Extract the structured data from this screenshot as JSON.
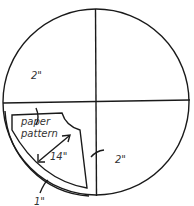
{
  "diagram": {
    "labels": {
      "top_margin": "2\"",
      "pattern_line1": "paper",
      "pattern_line2": "pattern",
      "dimension": "14\"",
      "right_margin": "2\"",
      "bottom_margin": "1\""
    },
    "colors": {
      "stroke": "#1a1a1a",
      "text": "#333333"
    }
  }
}
